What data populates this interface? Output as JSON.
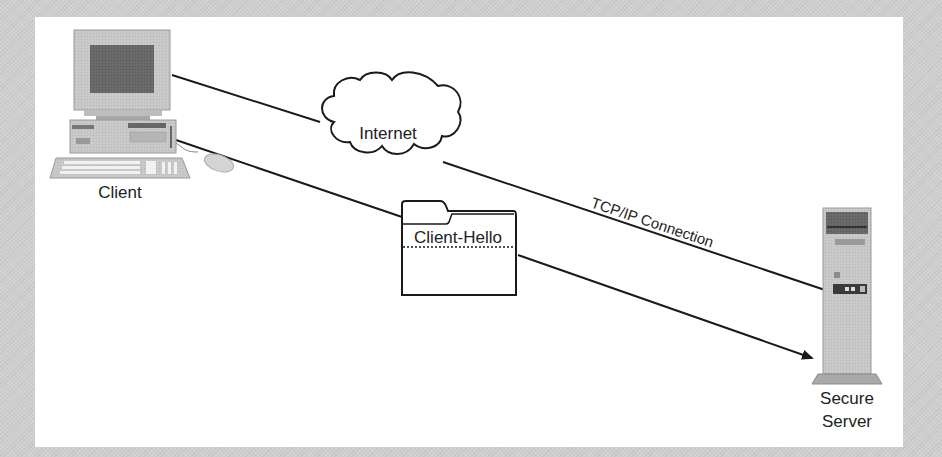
{
  "diagram": {
    "nodes": {
      "client": {
        "label": "Client"
      },
      "internet": {
        "label": "Internet"
      },
      "message": {
        "label": "Client-Hello"
      },
      "server": {
        "label_line1": "Secure",
        "label_line2": "Server"
      }
    },
    "edges": {
      "tcp_connection": {
        "label": "TCP/IP Connection",
        "from": "Client",
        "to": "Secure Server",
        "via": "Internet"
      },
      "hello_message": {
        "from": "Client",
        "to": "Secure Server",
        "carries": "Client-Hello",
        "arrow": true
      }
    },
    "colors": {
      "background": "#cfcfcf",
      "panel": "#ffffff",
      "line": "#1a1a1a",
      "device": "#c8c8c8"
    }
  }
}
